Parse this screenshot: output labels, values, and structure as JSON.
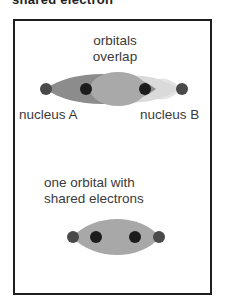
{
  "header": {
    "cut_text": "shared electron"
  },
  "diagram": {
    "top": {
      "title_line1": "orbitals",
      "title_line2": "overlap",
      "left_label": "nucleus A",
      "right_label": "nucleus B"
    },
    "bottom": {
      "title_line1": "one orbital with",
      "title_line2": "shared electrons"
    },
    "colors": {
      "nucleus": "#4a4a4a",
      "electron": "#1a1a1a",
      "orbital_dark": "#8a8a8a",
      "orbital_light": "#d8d8d8",
      "orbital_shared": "#a8a8a8",
      "border": "#1e1e1e"
    }
  }
}
